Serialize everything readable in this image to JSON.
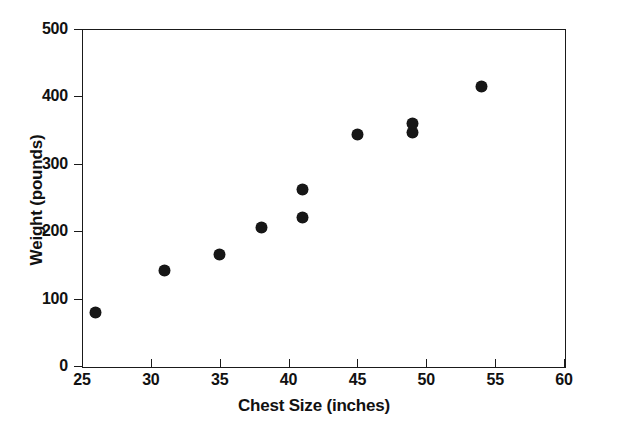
{
  "chart_data": {
    "type": "scatter",
    "title": "",
    "xlabel": "Chest Size (inches)",
    "ylabel": "Weight (pounds)",
    "xlim": [
      25,
      60
    ],
    "ylim": [
      0,
      500
    ],
    "xticks": [
      25,
      30,
      35,
      40,
      45,
      50,
      55,
      60
    ],
    "xtick_labels": [
      "25",
      "30",
      "35",
      "40",
      "45",
      "50",
      "55",
      "60"
    ],
    "yticks": [
      0,
      100,
      200,
      300,
      400,
      500
    ],
    "ytick_labels": [
      "0",
      "100",
      "200",
      "300",
      "400",
      "500"
    ],
    "grid": false,
    "legend": null,
    "marker": "filled-circle",
    "marker_color": "#171717",
    "points": [
      {
        "x": 26,
        "y": 80
      },
      {
        "x": 31,
        "y": 142
      },
      {
        "x": 35,
        "y": 165
      },
      {
        "x": 38,
        "y": 205
      },
      {
        "x": 41,
        "y": 220
      },
      {
        "x": 41,
        "y": 262
      },
      {
        "x": 45,
        "y": 343
      },
      {
        "x": 49,
        "y": 347
      },
      {
        "x": 49,
        "y": 360
      },
      {
        "x": 54,
        "y": 414
      }
    ]
  }
}
